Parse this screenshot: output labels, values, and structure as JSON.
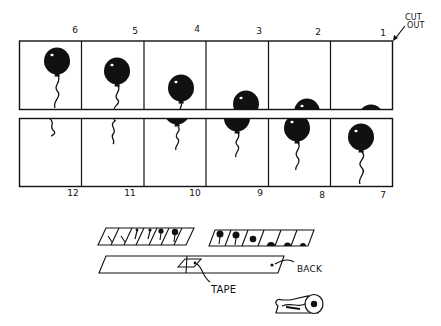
{
  "diagram": {
    "title": "",
    "ink_color": "#111111",
    "paper_color": "#ffffff",
    "cut_out_label": [
      "CUT",
      "OUT"
    ],
    "top_strip": {
      "frames": [
        {
          "number": "6",
          "balloon_cy": 60,
          "visible": "full"
        },
        {
          "number": "5",
          "balloon_cy": 70,
          "visible": "full"
        },
        {
          "number": "4",
          "balloon_cy": 87,
          "visible": "full"
        },
        {
          "number": "3",
          "balloon_cy": 102,
          "visible": "top"
        },
        {
          "number": "2",
          "balloon_cy": 108,
          "visible": "top"
        },
        {
          "number": "1",
          "balloon_cy": 113,
          "visible": "top"
        }
      ]
    },
    "bottom_strip": {
      "frames": [
        {
          "number": "12",
          "content": "string only"
        },
        {
          "number": "11",
          "content": "string with knot"
        },
        {
          "number": "10",
          "content": "balloon bottom and string"
        },
        {
          "number": "9",
          "content": "balloon lower half and string"
        },
        {
          "number": "8",
          "content": "balloon mostly visible"
        },
        {
          "number": "7",
          "content": "full balloon"
        }
      ]
    },
    "assembly": {
      "tape_label": "TAPE",
      "back_label": "BACK"
    }
  }
}
